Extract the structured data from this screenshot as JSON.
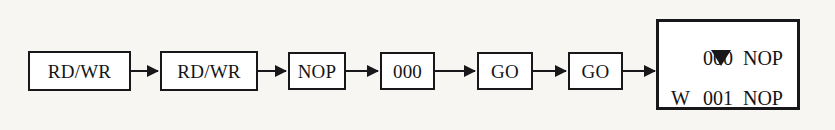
{
  "diagram": {
    "type": "flow-sequence",
    "background_color": "#f7f6f3",
    "line_color": "#18181a",
    "box_fill": "#ffffff",
    "nodes": [
      {
        "id": "node-1",
        "label": "RD/WR",
        "x": 28,
        "y": 51,
        "width": 103,
        "height": 40
      },
      {
        "id": "node-2",
        "label": "RD/WR",
        "x": 160,
        "y": 51,
        "width": 98,
        "height": 40
      },
      {
        "id": "node-3",
        "label": "NOP",
        "x": 288,
        "y": 52,
        "width": 58,
        "height": 38
      },
      {
        "id": "node-4",
        "label": "000",
        "x": 380,
        "y": 52,
        "width": 55,
        "height": 38
      },
      {
        "id": "node-5",
        "label": "GO",
        "x": 477,
        "y": 52,
        "width": 56,
        "height": 38
      },
      {
        "id": "node-6",
        "label": "GO",
        "x": 568,
        "y": 52,
        "width": 55,
        "height": 38
      }
    ],
    "arrows": [
      {
        "id": "arrow-1",
        "from": "node-1",
        "to": "node-2",
        "x": 131,
        "y": 70,
        "length": 27
      },
      {
        "id": "arrow-2",
        "from": "node-2",
        "to": "node-3",
        "x": 258,
        "y": 70,
        "length": 28
      },
      {
        "id": "arrow-3",
        "from": "node-3",
        "to": "node-4",
        "x": 346,
        "y": 70,
        "length": 32
      },
      {
        "id": "arrow-4",
        "from": "node-4",
        "to": "node-5",
        "x": 435,
        "y": 70,
        "length": 40
      },
      {
        "id": "arrow-5",
        "from": "node-5",
        "to": "node-6",
        "x": 533,
        "y": 70,
        "length": 33
      },
      {
        "id": "arrow-6",
        "from": "node-6",
        "to": "display",
        "x": 623,
        "y": 70,
        "length": 32
      }
    ],
    "display": {
      "x": 656,
      "y": 19,
      "width": 144,
      "height": 91,
      "lines": [
        {
          "marker": "▼",
          "marker_kind": "triangle-down",
          "address": "000",
          "operation": "NOP"
        },
        {
          "marker": "W",
          "marker_kind": "text",
          "address": "001",
          "operation": "NOP"
        }
      ]
    }
  }
}
